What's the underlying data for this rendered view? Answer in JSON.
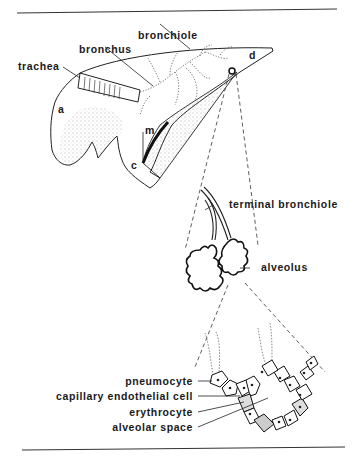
{
  "figure": {
    "labels": {
      "bronchiole": "bronchiole",
      "bronchus": "bronchus",
      "trachea": "trachea",
      "lobe_a": "a",
      "lobe_d": "d",
      "lobe_m": "m",
      "lobe_c": "c",
      "terminal_bronchiole": "terminal bronchiole",
      "alveolus": "alveolus",
      "pneumocyte": "pneumocyte",
      "capillary_endothelial_cell": "capillary endothelial cell",
      "erythrocyte": "erythrocyte",
      "alveolar_space": "alveolar space"
    },
    "colors": {
      "ink": "#1a1a1a",
      "stipple": "#555555",
      "background": "#ffffff"
    }
  }
}
